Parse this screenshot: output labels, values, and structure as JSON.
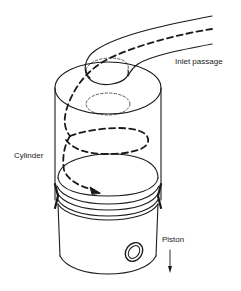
{
  "diagram": {
    "type": "technical-illustration",
    "labels": {
      "inlet_passage": "Inlet passage",
      "cylinder": "Cylinder",
      "piston": "Piston"
    },
    "components": [
      {
        "name": "inlet-passage",
        "description": "Curved tube entering the cylinder head from upper right"
      },
      {
        "name": "cylinder",
        "description": "Transparent vertical cylinder with elliptical top"
      },
      {
        "name": "valve-seat",
        "description": "Dashed ellipses on the cylinder head"
      },
      {
        "name": "swirl-flow-path",
        "description": "Dashed helical flow line with arrowhead"
      },
      {
        "name": "piston",
        "description": "Piston with three rings and gudgeon-pin hole"
      },
      {
        "name": "piston-motion-arrow",
        "description": "Downward arrow indicating piston movement"
      }
    ],
    "colors": {
      "line": "#1a1a1a",
      "background": "#ffffff"
    }
  }
}
